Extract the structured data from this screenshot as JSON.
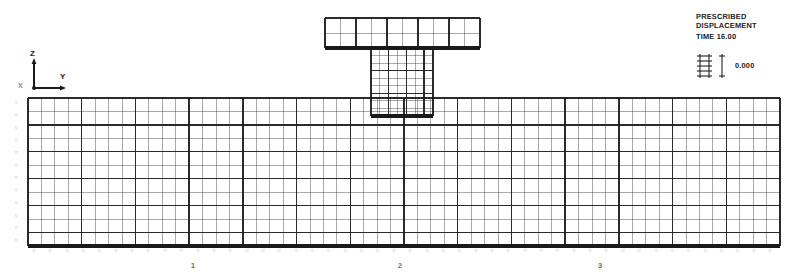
{
  "plot": {
    "title_lines": [
      "PRESCRIBED",
      "DISPLACEMENT"
    ],
    "time_label": "TIME 16.00",
    "scale_value": "0.000",
    "scale_icon": "displacement-scale-icon",
    "background": "#ffffff",
    "line_color": "#1a1a1a"
  },
  "axes": {
    "vertical_label": "Z",
    "horizontal_label": "Y",
    "origin_label": "X"
  },
  "bottom_axis": {
    "ticks": [
      {
        "label": "1",
        "x": 193
      },
      {
        "label": "2",
        "x": 400
      },
      {
        "label": "3",
        "x": 600
      }
    ]
  },
  "chart_data": {
    "type": "mesh",
    "title": "PRESCRIBED DISPLACEMENT",
    "subtitle": "TIME 16.00",
    "xlabel": "Y",
    "ylabel": "Z",
    "legend_position": "top-right",
    "grid": true,
    "components": [
      {
        "name": "top-flange-mesh",
        "x": 325,
        "y": 18,
        "width": 155,
        "height": 30,
        "cols": 10,
        "rows": 2,
        "heavy_every_col": 2,
        "heavy_every_row": 2,
        "bottom_edge": "thick"
      },
      {
        "name": "web-mesh",
        "x": 371,
        "y": 48,
        "width": 62,
        "height": 68,
        "cols": 7,
        "rows": 9,
        "heavy_every_col": 2,
        "heavy_every_row": 3,
        "bottom_edge": "thick"
      },
      {
        "name": "slab-mesh",
        "x": 28,
        "y": 98,
        "width": 752,
        "height": 148,
        "cols": 56,
        "rows": 11,
        "heavy_every_col": 4,
        "heavy_every_row": 2,
        "bottom_edge": "thick"
      }
    ],
    "node_labels_left_count": 12,
    "node_labels_bottom_count": 46,
    "support_row_label": "restraint-symbols"
  }
}
